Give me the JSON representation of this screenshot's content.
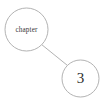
{
  "diagram": {
    "type": "node-link-graph",
    "background_color": "#ffffff",
    "stroke_color": "#a9a9a9",
    "text_color": "#3a3a3a",
    "nodes": [
      {
        "id": "chapter-node",
        "label": "chapter",
        "shape": "circle",
        "cx": 26.5,
        "cy": 29.5,
        "r": 21.5
      },
      {
        "id": "number-node",
        "label": "3",
        "shape": "circle",
        "cx": 80.5,
        "cy": 78.5,
        "r": 18.5
      }
    ],
    "edges": [
      {
        "id": "chapter-to-number",
        "from": "chapter-node",
        "to": "number-node",
        "x1": 41.8,
        "y1": 44.7,
        "x2": 67.4,
        "y2": 65.4
      }
    ]
  }
}
